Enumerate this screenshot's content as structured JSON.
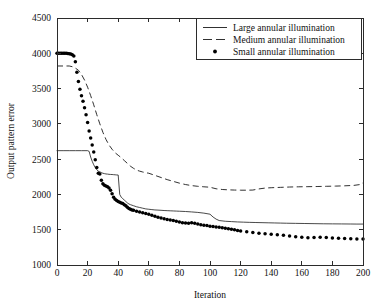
{
  "chart_data": {
    "type": "line",
    "title": "",
    "xlabel": "Iteration",
    "ylabel": "Output pattern error",
    "xlim": [
      0,
      200
    ],
    "ylim": [
      1000,
      4500
    ],
    "xticks": [
      0,
      20,
      40,
      60,
      80,
      100,
      120,
      140,
      160,
      180,
      200
    ],
    "yticks": [
      1000,
      1500,
      2000,
      2500,
      3000,
      3500,
      4000,
      4500
    ],
    "grid": false,
    "legend_position": "top-right",
    "series": [
      {
        "name": "Large annular illumination",
        "style": "solid",
        "color": "#1a1a1a",
        "x": [
          0,
          4,
          8,
          12,
          16,
          20,
          21,
          22,
          23,
          24,
          25,
          26,
          27,
          28,
          29,
          30,
          31,
          32,
          33,
          34,
          35,
          36,
          37,
          38,
          39,
          40,
          41,
          42,
          43,
          44,
          45,
          46,
          47,
          48,
          50,
          52,
          54,
          56,
          58,
          60,
          62,
          64,
          66,
          68,
          70,
          72,
          74,
          76,
          78,
          80,
          84,
          88,
          92,
          96,
          100,
          102,
          104,
          106,
          110,
          114,
          118,
          122,
          126,
          130,
          134,
          138,
          142,
          146,
          150,
          156,
          162,
          168,
          174,
          180,
          186,
          192,
          196,
          200
        ],
        "y": [
          2620,
          2620,
          2620,
          2620,
          2620,
          2620,
          2610,
          2530,
          2470,
          2420,
          2380,
          2350,
          2330,
          2320,
          2310,
          2300,
          2295,
          2290,
          2288,
          2285,
          2283,
          2282,
          2280,
          2278,
          2276,
          2275,
          2000,
          1960,
          1940,
          1920,
          1900,
          1880,
          1865,
          1855,
          1840,
          1825,
          1815,
          1805,
          1795,
          1790,
          1785,
          1780,
          1778,
          1775,
          1772,
          1770,
          1768,
          1766,
          1764,
          1762,
          1758,
          1752,
          1745,
          1735,
          1720,
          1680,
          1650,
          1630,
          1620,
          1615,
          1610,
          1607,
          1604,
          1602,
          1600,
          1598,
          1596,
          1594,
          1592,
          1590,
          1588,
          1586,
          1584,
          1583,
          1582,
          1581,
          1580,
          1580
        ]
      },
      {
        "name": "Medium annular illumination",
        "style": "dashed",
        "color": "#1a1a1a",
        "x": [
          0,
          4,
          8,
          10,
          12,
          14,
          16,
          18,
          20,
          22,
          24,
          26,
          28,
          30,
          32,
          34,
          36,
          38,
          40,
          42,
          44,
          46,
          48,
          50,
          52,
          54,
          56,
          58,
          60,
          64,
          68,
          72,
          76,
          80,
          84,
          88,
          92,
          96,
          100,
          104,
          108,
          112,
          116,
          120,
          124,
          128,
          132,
          136,
          140,
          146,
          152,
          158,
          164,
          170,
          176,
          182,
          188,
          194,
          198,
          200
        ],
        "y": [
          3820,
          3820,
          3820,
          3810,
          3790,
          3760,
          3700,
          3620,
          3520,
          3400,
          3270,
          3130,
          3000,
          2880,
          2780,
          2700,
          2640,
          2590,
          2555,
          2520,
          2480,
          2440,
          2400,
          2370,
          2345,
          2330,
          2318,
          2308,
          2300,
          2270,
          2240,
          2210,
          2185,
          2160,
          2140,
          2125,
          2115,
          2108,
          2102,
          2080,
          2070,
          2065,
          2062,
          2060,
          2060,
          2062,
          2078,
          2090,
          2095,
          2100,
          2105,
          2108,
          2110,
          2112,
          2115,
          2118,
          2122,
          2128,
          2140,
          2165
        ]
      },
      {
        "name": "Small annular illumination",
        "style": "dots",
        "color": "#000000",
        "x": [
          0,
          1,
          2,
          3,
          4,
          5,
          6,
          7,
          8,
          9,
          10,
          11,
          12,
          13,
          14,
          15,
          16,
          17,
          18,
          19,
          20,
          21,
          22,
          23,
          24,
          25,
          26,
          27,
          28,
          29,
          30,
          31,
          32,
          33,
          34,
          35,
          36,
          37,
          38,
          39,
          40,
          41,
          42,
          43,
          44,
          45,
          46,
          47,
          48,
          49,
          50,
          52,
          54,
          56,
          58,
          60,
          62,
          64,
          66,
          68,
          70,
          72,
          74,
          76,
          78,
          80,
          82,
          84,
          86,
          88,
          90,
          92,
          94,
          96,
          98,
          100,
          102,
          104,
          106,
          108,
          110,
          112,
          114,
          116,
          118,
          120,
          124,
          128,
          132,
          136,
          140,
          144,
          148,
          152,
          156,
          160,
          164,
          168,
          172,
          176,
          180,
          184,
          188,
          192,
          196,
          200
        ],
        "y": [
          4000,
          4000,
          4000,
          4000,
          4000,
          4000,
          4000,
          3998,
          3995,
          3990,
          3980,
          3960,
          3880,
          3730,
          3600,
          3490,
          3400,
          3320,
          3230,
          3130,
          3020,
          2900,
          2800,
          2700,
          2600,
          2490,
          2380,
          2300,
          2290,
          2200,
          2150,
          2130,
          2120,
          2110,
          2090,
          2060,
          2010,
          1960,
          1930,
          1915,
          1900,
          1890,
          1880,
          1870,
          1855,
          1840,
          1820,
          1800,
          1790,
          1780,
          1775,
          1760,
          1750,
          1740,
          1728,
          1718,
          1705,
          1690,
          1675,
          1665,
          1655,
          1645,
          1638,
          1630,
          1620,
          1610,
          1600,
          1595,
          1592,
          1598,
          1590,
          1580,
          1572,
          1565,
          1558,
          1550,
          1545,
          1540,
          1535,
          1528,
          1520,
          1512,
          1505,
          1498,
          1490,
          1482,
          1470,
          1460,
          1450,
          1442,
          1435,
          1428,
          1420,
          1410,
          1400,
          1392,
          1385,
          1388,
          1392,
          1388,
          1382,
          1378,
          1374,
          1372,
          1370,
          1370
        ]
      }
    ]
  },
  "axes": {
    "ylabel": "Output pattern error",
    "xlabel": "Iteration",
    "xtick_labels": [
      "0",
      "20",
      "40",
      "60",
      "80",
      "100",
      "120",
      "140",
      "160",
      "180",
      "200"
    ],
    "ytick_labels": [
      "1000",
      "1500",
      "2000",
      "2500",
      "3000",
      "3500",
      "4000",
      "4500"
    ]
  },
  "legend": {
    "entries": [
      {
        "label": "Large annular illumination",
        "marker": "solid-line"
      },
      {
        "label": "Medium annular illumination",
        "marker": "dashed-line"
      },
      {
        "label": "Small annular illumination",
        "marker": "dot"
      }
    ]
  },
  "colors": {
    "axis": "#2b2b2b",
    "series": "#1a1a1a",
    "background": "#ffffff"
  }
}
